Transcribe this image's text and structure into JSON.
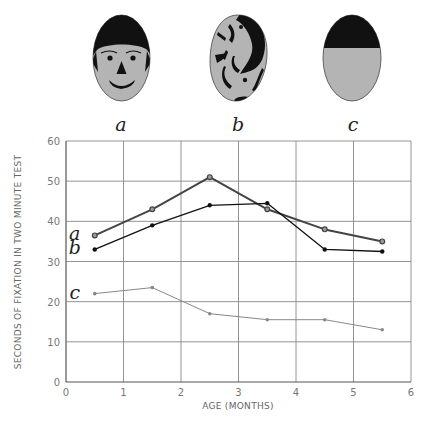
{
  "figure": {
    "faces": [
      {
        "id": "a",
        "label": "a",
        "description": "schematic face with hair, eyes, nose and smiling mouth"
      },
      {
        "id": "b",
        "label": "b",
        "description": "scrambled facial features"
      },
      {
        "id": "c",
        "label": "c",
        "description": "oval with solid black top, no features"
      }
    ],
    "colors": {
      "face_fill": "#b4b4b4",
      "face_features": "#111111",
      "series_a": "#444444",
      "series_b": "#111111",
      "series_c": "#888888",
      "grid": "#888888"
    }
  },
  "chart_data": {
    "type": "line",
    "title": "",
    "xlabel": "AGE (MONTHS)",
    "ylabel": "SECONDS OF FIXATION IN TWO MINUTE TEST",
    "xlim": [
      0,
      6
    ],
    "ylim": [
      0,
      60
    ],
    "xticks": [
      "0",
      "1",
      "2",
      "3",
      "4",
      "5",
      "6"
    ],
    "yticks": [
      "0",
      "10",
      "20",
      "30",
      "40",
      "50",
      "60"
    ],
    "grid": true,
    "legend": "inline labels a, b, c at start of each line",
    "x": [
      0.5,
      1.5,
      2.5,
      3.5,
      4.5,
      5.5
    ],
    "series": [
      {
        "name": "a",
        "values": [
          36.5,
          43,
          51,
          43,
          38,
          35
        ]
      },
      {
        "name": "b",
        "values": [
          33,
          39,
          44,
          44.5,
          33,
          32.5
        ]
      },
      {
        "name": "c",
        "values": [
          22,
          23.5,
          17,
          15.5,
          15.5,
          13
        ]
      }
    ]
  }
}
